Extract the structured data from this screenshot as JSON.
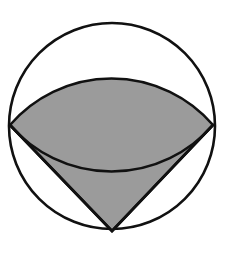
{
  "figure": {
    "background_color": "#ffffff",
    "stroke_color": "#111111",
    "shaded_fill_color": "#9b9b9b",
    "unshaded_fill_color": "#ffffff",
    "stroke_width": 2.6,
    "canvas": {
      "width": 230,
      "height": 253
    },
    "circle": {
      "label": "outer-circle",
      "center_x": 112,
      "center_y": 126,
      "radius": 103,
      "top_y": 23,
      "bottom_y": 229,
      "left_x": 9,
      "right_x": 215
    },
    "points": [
      {
        "label": "L",
        "name": "left-vertex",
        "x": 10,
        "y": 125
      },
      {
        "label": "R",
        "name": "right-vertex",
        "x": 213,
        "y": 125
      },
      {
        "label": "B",
        "name": "bottom-vertex",
        "x": 112,
        "y": 231
      }
    ],
    "top_arc": {
      "label": "upper-bulging-arc",
      "from_x": 10,
      "from_y": 125,
      "to_x": 213,
      "to_y": 125,
      "apex_x": 112,
      "apex_y": 79,
      "radius": 134,
      "sweep": 1,
      "large_arc": 0
    },
    "shaded_region": {
      "label": "shaded-fan-region",
      "description": "Region bounded by segment L-B, segment B-R, and the upward bulging arc from L to R",
      "path": "M 10 125 L 112 231 L 213 125 A 134 134 0 0 0 10 125 Z"
    },
    "edges": [
      {
        "name": "edge-left",
        "from": "L",
        "to": "B"
      },
      {
        "name": "edge-right",
        "from": "B",
        "to": "R"
      },
      {
        "name": "edge-arc-top",
        "from": "L",
        "to": "R"
      }
    ]
  }
}
